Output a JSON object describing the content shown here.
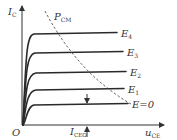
{
  "diagram": {
    "axes": {
      "y_label": {
        "main": "I",
        "sub": "C"
      },
      "x_label": {
        "main": "u",
        "sub": "CE"
      },
      "origin_label": "O"
    },
    "power_limit": {
      "main": "P",
      "sub": "CM",
      "style": "dashed"
    },
    "leakage": {
      "main": "I",
      "sub": "CEO"
    },
    "curves": [
      {
        "id": "E4",
        "label_main": "E",
        "label_sub": "4",
        "level": 4
      },
      {
        "id": "E3",
        "label_main": "E",
        "label_sub": "3",
        "level": 3
      },
      {
        "id": "E2",
        "label_main": "E",
        "label_sub": "2",
        "level": 2
      },
      {
        "id": "E1",
        "label_main": "E",
        "label_sub": "1",
        "level": 1
      },
      {
        "id": "E0",
        "label_main": "E=0",
        "label_sub": "",
        "level": 0
      }
    ],
    "colors": {
      "line": "#2a2a2a",
      "text": "#333333",
      "background": "#ffffff"
    }
  }
}
